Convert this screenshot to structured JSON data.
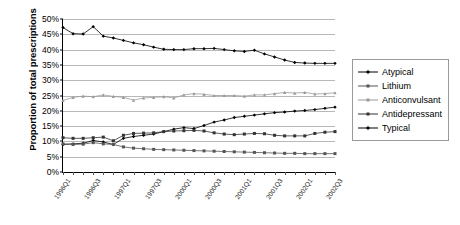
{
  "chart_data": {
    "type": "line",
    "title": "",
    "xlabel": "",
    "ylabel": "Proportion of total prescriptions",
    "ylim": [
      0,
      50
    ],
    "ytick_labels": [
      "0%",
      "5%",
      "10%",
      "15%",
      "20%",
      "25%",
      "30%",
      "35%",
      "40%",
      "45%",
      "50%"
    ],
    "ytick_values": [
      0,
      5,
      10,
      15,
      20,
      25,
      30,
      35,
      40,
      45,
      50
    ],
    "grid": true,
    "legend_position": "right",
    "x": [
      "1996Q1",
      "1996Q2",
      "1996Q3",
      "1996Q4",
      "1997Q1",
      "1997Q2",
      "1997Q3",
      "1997Q4",
      "1998Q1",
      "1998Q2",
      "1998Q3",
      "1998Q4",
      "1999Q1",
      "1999Q2",
      "1999Q3",
      "1999Q4",
      "2000Q1",
      "2000Q2",
      "2000Q3",
      "2000Q4",
      "2001Q1",
      "2001Q2",
      "2001Q3",
      "2001Q4",
      "2002Q1",
      "2002Q2",
      "2002Q3",
      "2002Q4"
    ],
    "xtick_labels": [
      "1996Q1",
      "1996Q3",
      "1997Q1",
      "1997Q3",
      "1998Q1",
      "1998Q3",
      "1999Q1",
      "1999Q3",
      "2000Q1",
      "2000Q3",
      "2001Q1",
      "2001Q3",
      "2002Q1",
      "2002Q3"
    ],
    "xtick_indices": [
      0,
      2,
      4,
      6,
      8,
      10,
      12,
      14,
      16,
      18,
      20,
      22,
      24,
      26
    ],
    "xtick_labels_shown": [
      "1996Q1",
      "1996Q3",
      "1997Q1",
      "1997Q3",
      "2000Q1",
      "2000Q3",
      "2001Q1",
      "2001Q3",
      "2002Q1",
      "2002Q3"
    ],
    "xtick_label_indices": [
      0,
      3,
      6,
      9,
      12,
      15,
      18,
      21,
      24,
      27
    ],
    "series": [
      {
        "name": "Atypical",
        "color": "#000000",
        "marker": "diamond",
        "values": [
          9.0,
          9.2,
          9.4,
          10.3,
          9.8,
          9.0,
          11.0,
          11.6,
          12.0,
          12.4,
          13.2,
          14.0,
          14.5,
          14.2,
          15.2,
          16.3,
          17.0,
          17.8,
          18.2,
          18.6,
          19.0,
          19.4,
          19.6,
          19.9,
          20.1,
          20.4,
          20.8,
          21.2
        ]
      },
      {
        "name": "Lithium",
        "color": "#555555",
        "marker": "square",
        "values": [
          9.2,
          9.0,
          9.1,
          9.6,
          9.2,
          9.0,
          8.2,
          7.8,
          7.6,
          7.4,
          7.3,
          7.2,
          7.1,
          7.0,
          6.9,
          6.8,
          6.7,
          6.6,
          6.5,
          6.4,
          6.3,
          6.2,
          6.1,
          6.1,
          6.0,
          6.0,
          6.0,
          6.0
        ]
      },
      {
        "name": "Anticonvulsant",
        "color": "#9a9a9a",
        "marker": "triangle",
        "values": [
          23.4,
          24.4,
          24.8,
          24.6,
          25.2,
          24.7,
          24.4,
          23.5,
          24.2,
          24.4,
          24.6,
          24.2,
          25.2,
          25.6,
          25.4,
          25.0,
          25.0,
          25.0,
          24.8,
          25.2,
          25.2,
          25.6,
          26.0,
          25.8,
          26.0,
          25.5,
          25.6,
          25.9
        ]
      },
      {
        "name": "Antidepressant",
        "color": "#333333",
        "marker": "square",
        "values": [
          11.2,
          11.0,
          11.0,
          11.2,
          11.4,
          10.2,
          12.0,
          12.6,
          12.7,
          12.8,
          13.2,
          13.4,
          13.5,
          13.6,
          13.4,
          12.8,
          12.4,
          12.2,
          12.4,
          12.6,
          12.5,
          12.0,
          11.8,
          11.8,
          11.8,
          12.6,
          13.0,
          13.2
        ]
      },
      {
        "name": "Typical",
        "color": "#000000",
        "marker": "diamond",
        "values": [
          47.2,
          45.2,
          45.1,
          47.5,
          44.4,
          43.8,
          43.0,
          42.2,
          41.6,
          40.8,
          40.1,
          40.0,
          40.0,
          40.3,
          40.3,
          40.4,
          40.0,
          39.6,
          39.4,
          39.8,
          38.6,
          37.6,
          36.6,
          35.8,
          35.6,
          35.5,
          35.5,
          35.5
        ]
      }
    ]
  }
}
